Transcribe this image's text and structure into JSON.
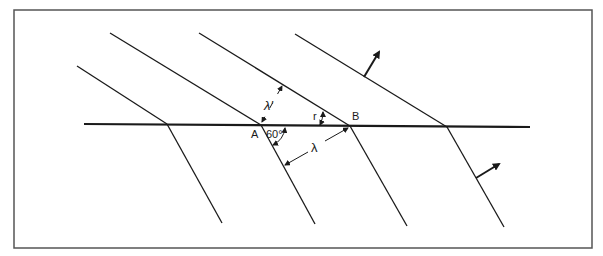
{
  "figure": {
    "frame": {
      "x": 14,
      "y": 10,
      "width": 578,
      "height": 238,
      "stroke": "#555555"
    },
    "colors": {
      "line": "#1a1a1a",
      "background": "#ffffff"
    },
    "interface": {
      "x1": 84,
      "y1": 124,
      "x2": 530,
      "y2": 127
    },
    "incident_wavefronts": [
      {
        "x1": 77,
        "y1": 66,
        "x2": 167,
        "y2": 124
      },
      {
        "x1": 110,
        "y1": 33,
        "x2": 261,
        "y2": 125
      },
      {
        "x1": 199,
        "y1": 33,
        "x2": 350,
        "y2": 126
      },
      {
        "x1": 295,
        "y1": 34,
        "x2": 447,
        "y2": 127
      }
    ],
    "refracted_wavefronts": [
      {
        "x1": 167,
        "y1": 124,
        "x2": 222,
        "y2": 223
      },
      {
        "x1": 261,
        "y1": 125,
        "x2": 315,
        "y2": 224
      },
      {
        "x1": 350,
        "y1": 126,
        "x2": 407,
        "y2": 226
      },
      {
        "x1": 447,
        "y1": 127,
        "x2": 504,
        "y2": 227
      }
    ],
    "propagation_arrows": [
      {
        "name": "incident-direction",
        "x1": 364,
        "y1": 77,
        "x2": 379,
        "y2": 52
      },
      {
        "name": "refracted-direction",
        "x1": 476,
        "y1": 178,
        "x2": 499,
        "y2": 164
      }
    ],
    "labels": {
      "point_a": "A",
      "point_b": "B",
      "angle_incidence": "60°",
      "angle_refraction": "r",
      "wavelength_refracted": "λ",
      "wavelength_incident": "λ'"
    }
  }
}
